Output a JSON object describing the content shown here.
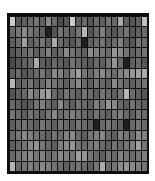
{
  "chart_data": {
    "type": "heatmap",
    "title": "",
    "xlabel": "",
    "ylabel": "",
    "colormap": "grayscale",
    "rows": 15,
    "cols": 23,
    "legend": null,
    "grid": true,
    "values": [
      [
        0.85,
        0.3,
        0.35,
        0.4,
        0.45,
        0.35,
        0.55,
        0.4,
        0.25,
        0.3,
        0.85,
        0.35,
        0.4,
        0.3,
        0.4,
        0.35,
        0.45,
        0.4,
        0.7,
        0.35,
        0.3,
        0.35,
        0.8
      ],
      [
        0.4,
        0.45,
        0.55,
        0.45,
        0.4,
        0.35,
        0.05,
        0.3,
        0.45,
        0.4,
        0.35,
        0.45,
        0.75,
        0.3,
        0.4,
        0.5,
        0.35,
        0.3,
        0.4,
        0.45,
        0.3,
        0.35,
        0.4
      ],
      [
        0.35,
        0.4,
        0.65,
        0.35,
        0.4,
        0.45,
        0.35,
        0.7,
        0.4,
        0.35,
        0.3,
        0.4,
        0.05,
        0.35,
        0.4,
        0.45,
        0.35,
        0.4,
        0.5,
        0.35,
        0.3,
        0.45,
        0.4
      ],
      [
        0.3,
        0.35,
        0.4,
        0.45,
        0.35,
        0.4,
        0.5,
        0.35,
        0.4,
        0.55,
        0.45,
        0.4,
        0.35,
        0.55,
        0.5,
        0.45,
        0.4,
        0.6,
        0.55,
        0.45,
        0.35,
        0.4,
        0.45
      ],
      [
        0.25,
        0.3,
        0.35,
        0.4,
        0.7,
        0.35,
        0.3,
        0.4,
        0.35,
        0.3,
        0.45,
        0.4,
        0.35,
        0.3,
        0.4,
        0.35,
        0.45,
        0.6,
        0.4,
        0.05,
        0.35,
        0.4,
        0.3
      ],
      [
        0.35,
        0.4,
        0.3,
        0.35,
        0.4,
        0.45,
        0.35,
        0.55,
        0.5,
        0.4,
        0.55,
        0.65,
        0.45,
        0.4,
        0.5,
        0.55,
        0.45,
        0.4,
        0.5,
        0.55,
        0.6,
        0.65,
        0.7
      ],
      [
        0.75,
        0.35,
        0.4,
        0.45,
        0.35,
        0.4,
        0.5,
        0.45,
        0.4,
        0.35,
        0.45,
        0.55,
        0.4,
        0.35,
        0.45,
        0.4,
        0.35,
        0.55,
        0.45,
        0.4,
        0.35,
        0.4,
        0.45
      ],
      [
        0.3,
        0.35,
        0.4,
        0.55,
        0.45,
        0.6,
        0.65,
        0.4,
        0.35,
        0.45,
        0.4,
        0.35,
        0.45,
        0.4,
        0.35,
        0.45,
        0.4,
        0.35,
        0.45,
        0.75,
        0.4,
        0.35,
        0.3
      ],
      [
        0.4,
        0.35,
        0.3,
        0.35,
        0.45,
        0.5,
        0.4,
        0.35,
        0.55,
        0.4,
        0.35,
        0.45,
        0.4,
        0.35,
        0.5,
        0.45,
        0.6,
        0.55,
        0.4,
        0.35,
        0.45,
        0.4,
        0.35
      ],
      [
        0.45,
        0.4,
        0.35,
        0.45,
        0.4,
        0.35,
        0.45,
        0.55,
        0.4,
        0.45,
        0.5,
        0.45,
        0.4,
        0.35,
        0.45,
        0.4,
        0.35,
        0.45,
        0.5,
        0.4,
        0.35,
        0.45,
        0.4
      ],
      [
        0.35,
        0.4,
        0.45,
        0.4,
        0.35,
        0.45,
        0.4,
        0.35,
        0.45,
        0.4,
        0.35,
        0.45,
        0.4,
        0.35,
        0.05,
        0.4,
        0.45,
        0.4,
        0.35,
        0.05,
        0.4,
        0.45,
        0.4
      ],
      [
        0.4,
        0.45,
        0.55,
        0.5,
        0.45,
        0.4,
        0.35,
        0.45,
        0.4,
        0.5,
        0.55,
        0.4,
        0.35,
        0.45,
        0.5,
        0.55,
        0.4,
        0.35,
        0.5,
        0.45,
        0.4,
        0.55,
        0.5
      ],
      [
        0.35,
        0.4,
        0.45,
        0.55,
        0.6,
        0.45,
        0.4,
        0.35,
        0.5,
        0.55,
        0.6,
        0.45,
        0.4,
        0.45,
        0.5,
        0.4,
        0.35,
        0.45,
        0.4,
        0.45,
        0.5,
        0.65,
        0.45
      ],
      [
        0.4,
        0.45,
        0.5,
        0.55,
        0.45,
        0.5,
        0.4,
        0.45,
        0.55,
        0.5,
        0.45,
        0.65,
        0.6,
        0.45,
        0.4,
        0.35,
        0.45,
        0.4,
        0.5,
        0.45,
        0.4,
        0.45,
        0.5
      ],
      [
        0.75,
        0.4,
        0.45,
        0.5,
        0.45,
        0.55,
        0.5,
        0.45,
        0.4,
        0.35,
        0.4,
        0.45,
        0.4,
        0.35,
        0.45,
        0.7,
        0.4,
        0.45,
        0.55,
        0.6,
        0.55,
        0.5,
        0.45
      ]
    ]
  },
  "caption": ""
}
